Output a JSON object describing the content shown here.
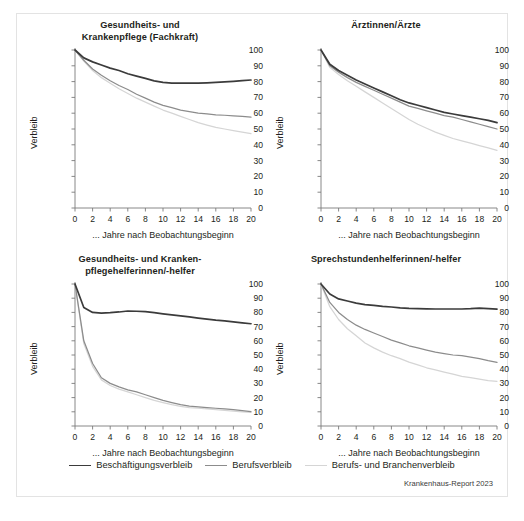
{
  "figure": {
    "credit": "Krankenhaus-Report 2023",
    "y_axis_label": "Verbleib",
    "x_axis_label": "... Jahre nach Beobachtungsbeginn",
    "y_ticks": [
      0,
      10,
      20,
      30,
      40,
      50,
      60,
      70,
      80,
      90,
      100
    ],
    "x_ticks": [
      0,
      2,
      4,
      6,
      8,
      10,
      12,
      14,
      16,
      18,
      20
    ],
    "colors": {
      "beschaeftigung": "#3b3b3b",
      "beruf": "#8c8c8c",
      "beruf_branche": "#d5d5d5",
      "axis": "#7a7a7a",
      "frame": "#e3e3e3",
      "text": "#231f20"
    }
  },
  "legend": {
    "items": [
      {
        "label": "Beschäftigungsverbleib",
        "color": "#3b3b3b"
      },
      {
        "label": "Berufsverbleib",
        "color": "#8c8c8c"
      },
      {
        "label": "Berufs- und Branchenverbleib",
        "color": "#d5d5d5"
      }
    ]
  },
  "chart_data": [
    {
      "type": "line",
      "title": "Gesundheits- und\nKrankenpflege (Fachkraft)",
      "xlabel": "... Jahre nach Beobachtungsbeginn",
      "ylabel": "Verbleib",
      "xlim": [
        0,
        20
      ],
      "ylim": [
        0,
        100
      ],
      "grid": false,
      "legend_position": "bottom",
      "x": [
        0,
        1,
        2,
        3,
        4,
        5,
        6,
        7,
        8,
        9,
        10,
        11,
        12,
        13,
        14,
        15,
        16,
        17,
        18,
        19,
        20
      ],
      "series": [
        {
          "name": "Beschäftigungsverbleib",
          "color": "#3b3b3b",
          "values": [
            100,
            95,
            92.5,
            90.5,
            88.5,
            87,
            85,
            83.5,
            82,
            80.5,
            79.5,
            79,
            79,
            79,
            79,
            79.2,
            79.5,
            79.8,
            80.2,
            80.6,
            81
          ]
        },
        {
          "name": "Berufsverbleib",
          "color": "#8c8c8c",
          "values": [
            100,
            93.5,
            88,
            84,
            80.5,
            77.5,
            75,
            72,
            69.5,
            67,
            65,
            63.5,
            62,
            61,
            60,
            59.5,
            59,
            58.7,
            58.3,
            58,
            57.5
          ]
        },
        {
          "name": "Berufs- und Branchenverbleib",
          "color": "#d5d5d5",
          "values": [
            100,
            93,
            87,
            82.5,
            79,
            75.5,
            72.5,
            69.5,
            67,
            64.5,
            62,
            60,
            58,
            56,
            54,
            52.5,
            51,
            50,
            49,
            48,
            47
          ]
        }
      ]
    },
    {
      "type": "line",
      "title": "Ärztinnen/Ärzte",
      "xlabel": "... Jahre nach Beobachtungsbeginn",
      "ylabel": "Verbleib",
      "xlim": [
        0,
        20
      ],
      "ylim": [
        0,
        100
      ],
      "grid": false,
      "legend_position": "bottom",
      "x": [
        0,
        1,
        2,
        3,
        4,
        5,
        6,
        7,
        8,
        9,
        10,
        11,
        12,
        13,
        14,
        15,
        16,
        17,
        18,
        19,
        20
      ],
      "series": [
        {
          "name": "Beschäftigungsverbleib",
          "color": "#3b3b3b",
          "values": [
            100,
            91,
            87,
            84,
            81,
            78.5,
            76,
            73.5,
            71,
            68.5,
            66.5,
            65,
            63.5,
            62,
            60.5,
            59.5,
            58.5,
            57.5,
            56.5,
            55.5,
            54
          ]
        },
        {
          "name": "Berufsverbleib",
          "color": "#8c8c8c",
          "values": [
            100,
            90,
            86,
            82.5,
            79.5,
            77,
            74.5,
            72,
            69.5,
            67,
            64.5,
            63,
            61.5,
            60,
            58.5,
            57.5,
            56,
            54.5,
            53,
            51.5,
            50
          ]
        },
        {
          "name": "Berufs- und Branchenverbleib",
          "color": "#d5d5d5",
          "values": [
            100,
            89,
            84.5,
            80.5,
            77,
            73.5,
            70,
            66.5,
            63,
            59.5,
            56,
            53,
            50.5,
            48,
            46,
            44,
            42.5,
            41,
            39.5,
            38,
            36.5
          ]
        }
      ]
    },
    {
      "type": "line",
      "title": "Gesundheits- und Kranken-\npflegehelferinnen/-helfer",
      "xlabel": "... Jahre nach Beobachtungsbeginn",
      "ylabel": "Verbleib",
      "xlim": [
        0,
        20
      ],
      "ylim": [
        0,
        100
      ],
      "grid": false,
      "legend_position": "bottom",
      "x": [
        0,
        1,
        2,
        3,
        4,
        5,
        6,
        7,
        8,
        9,
        10,
        11,
        12,
        13,
        14,
        15,
        16,
        17,
        18,
        19,
        20
      ],
      "series": [
        {
          "name": "Beschäftigungsverbleib",
          "color": "#3b3b3b",
          "values": [
            100,
            83.5,
            80,
            79.5,
            79.8,
            80.3,
            81,
            80.8,
            80.5,
            79.8,
            79,
            78.3,
            77.5,
            76.8,
            76,
            75.3,
            74.5,
            74,
            73.3,
            72.6,
            72
          ]
        },
        {
          "name": "Berufsverbleib",
          "color": "#8c8c8c",
          "values": [
            100,
            60,
            44,
            34,
            30,
            27.5,
            25.5,
            24,
            22,
            20,
            18,
            16.5,
            15,
            14,
            13.5,
            13,
            12.5,
            12,
            11.5,
            10.8,
            10.2
          ]
        },
        {
          "name": "Berufs- und Branchenverbleib",
          "color": "#d5d5d5",
          "values": [
            100,
            58,
            42,
            32.5,
            28.5,
            26,
            24,
            22,
            20,
            18,
            16.5,
            15,
            13.8,
            13,
            12.5,
            12,
            11.5,
            11,
            10.5,
            10,
            9.6
          ]
        }
      ]
    },
    {
      "type": "line",
      "title": "Sprechstundenhelferinnen/-helfer",
      "xlabel": "... Jahre nach Beobachtungsbeginn",
      "ylabel": "Verbleib",
      "xlim": [
        0,
        20
      ],
      "ylim": [
        0,
        100
      ],
      "grid": false,
      "legend_position": "bottom",
      "x": [
        0,
        1,
        2,
        3,
        4,
        5,
        6,
        7,
        8,
        9,
        10,
        11,
        12,
        13,
        14,
        15,
        16,
        17,
        18,
        19,
        20
      ],
      "series": [
        {
          "name": "Beschäftigungsverbleib",
          "color": "#3b3b3b",
          "values": [
            100,
            93,
            89.5,
            88,
            86.5,
            85.5,
            85,
            84.2,
            83.8,
            83.2,
            82.8,
            82.6,
            82.5,
            82.4,
            82.4,
            82.4,
            82.4,
            82.6,
            83,
            82.6,
            82.3
          ]
        },
        {
          "name": "Berufsverbleib",
          "color": "#8c8c8c",
          "values": [
            100,
            87,
            80,
            75,
            71,
            68,
            65.5,
            63,
            60.5,
            58.5,
            56.5,
            55,
            53.5,
            52,
            51,
            50,
            49.5,
            48.5,
            47.5,
            46,
            44.8
          ]
        },
        {
          "name": "Berufs- und Branchenverbleib",
          "color": "#d5d5d5",
          "values": [
            100,
            84,
            75,
            68.5,
            63.5,
            58.5,
            55,
            52,
            49.5,
            47.5,
            45,
            43,
            41,
            39.5,
            38,
            36.5,
            35,
            34,
            33,
            32,
            31.5
          ]
        }
      ]
    }
  ]
}
